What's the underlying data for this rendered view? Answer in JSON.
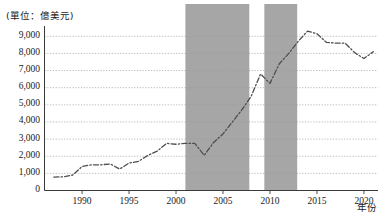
{
  "chart_data": {
    "type": "line",
    "title": "",
    "subtitle": "",
    "unit_label": "(單位：億美元)",
    "xlabel": "年份",
    "ylabel": "",
    "xlim": [
      1986.0,
      2021.5
    ],
    "ylim": [
      0,
      9600
    ],
    "grid": true,
    "legend": null,
    "line_style": "dash-dot",
    "line_color": "#4d4d4d",
    "shade_color": "#a6a6a6",
    "yticks": [
      0,
      1000,
      2000,
      3000,
      4000,
      5000,
      6000,
      7000,
      8000,
      9000
    ],
    "ytick_labels": [
      "0",
      "1,000",
      "2,000",
      "3,000",
      "4,000",
      "5,000",
      "6,000",
      "7,000",
      "8,000",
      "9,000"
    ],
    "xticks": [
      1990,
      1995,
      2000,
      2005,
      2010,
      2015,
      2020
    ],
    "xtick_labels": [
      "1990",
      "1995",
      "2000",
      "2005",
      "2010",
      "2015",
      "2020"
    ],
    "shaded_bands": [
      {
        "x0": 2001.0,
        "x1": 2007.8
      },
      {
        "x0": 2009.4,
        "x1": 2012.9
      }
    ],
    "x": [
      1987,
      1988,
      1989,
      1990,
      1991,
      1992,
      1993,
      1994,
      1995,
      1996,
      1997,
      1998,
      1999,
      2000,
      2001,
      2002,
      2003,
      2004,
      2005,
      2006,
      2007,
      2008,
      2009,
      2010,
      2011,
      2012,
      2013,
      2014,
      2015,
      2016,
      2017,
      2018,
      2019,
      2020,
      2021
    ],
    "values": [
      780,
      800,
      900,
      1400,
      1500,
      1500,
      1550,
      1250,
      1600,
      1700,
      2050,
      2300,
      2750,
      2700,
      2750,
      2750,
      2050,
      2800,
      3300,
      4000,
      4700,
      5500,
      6800,
      6250,
      7400,
      8000,
      8700,
      9300,
      9150,
      8650,
      8600,
      8600,
      8050,
      7700,
      8100
    ]
  },
  "axes": {
    "unit_label": "(單位：億美元)",
    "xaxis_title": "年份"
  }
}
